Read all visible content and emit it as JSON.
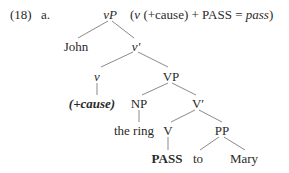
{
  "example": {
    "number": "(18)",
    "sub": "a."
  },
  "annotation": {
    "open": "(",
    "v": "v",
    "feature": "(+cause)",
    "plus": "+",
    "pass_label": "PASS",
    "equals": "=",
    "result": "pass",
    "close": ")"
  },
  "tree": {
    "root": "vP",
    "spec": "John",
    "vbar": "v′",
    "v": "v",
    "v_feature": "(+cause)",
    "vp": "VP",
    "np": "NP",
    "np_word": "the ring",
    "vbar2": "V′",
    "verb": "V",
    "verb_word": "PASS",
    "pp": "PP",
    "p_word": "to",
    "pp_obj": "Mary"
  },
  "colors": {
    "text": "#2a2a2a",
    "edge": "#8a8a8a",
    "background": "#ffffff"
  }
}
